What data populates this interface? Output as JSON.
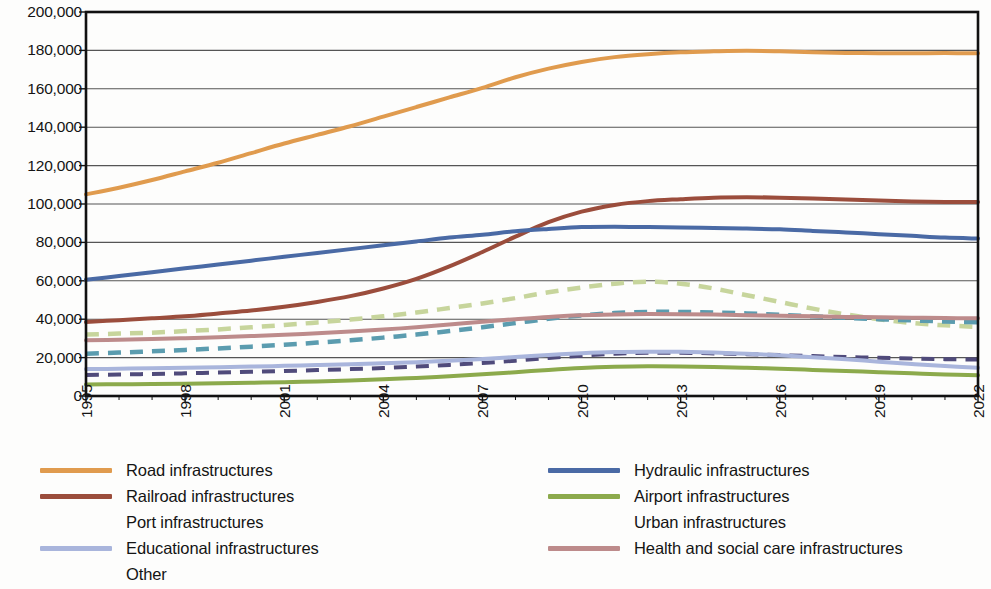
{
  "chart_data": {
    "type": "line",
    "title": "",
    "xlabel": "",
    "ylabel": "",
    "xlim": [
      1995,
      2022
    ],
    "ylim": [
      0,
      200000
    ],
    "ytick_step": 20000,
    "ytick_labels": [
      "0",
      "20,000",
      "40,000",
      "60,000",
      "80,000",
      "100,000",
      "120,000",
      "140,000",
      "160,000",
      "180,000",
      "200,000"
    ],
    "ytick_values": [
      0,
      20000,
      40000,
      60000,
      80000,
      100000,
      120000,
      140000,
      160000,
      180000,
      200000
    ],
    "xtick_labels": [
      "1995",
      "1998",
      "2001",
      "2004",
      "2007",
      "2010",
      "2013",
      "2016",
      "2019",
      "2022"
    ],
    "xtick_values": [
      1995,
      1998,
      2001,
      2004,
      2007,
      2010,
      2013,
      2016,
      2019,
      2022
    ],
    "x": [
      1995,
      1996,
      1997,
      1998,
      1999,
      2000,
      2001,
      2002,
      2003,
      2004,
      2005,
      2006,
      2007,
      2008,
      2009,
      2010,
      2011,
      2012,
      2013,
      2014,
      2015,
      2016,
      2017,
      2018,
      2019,
      2020,
      2021,
      2022
    ],
    "grid": "horizontal",
    "legend_position": "bottom",
    "legend_columns": 2,
    "series": [
      {
        "name": "Road infrastructures",
        "color": "#E09B4E",
        "style": "solid",
        "width": 4.0,
        "values": [
          105000,
          108500,
          112500,
          117000,
          121500,
          126500,
          131500,
          136000,
          140500,
          145500,
          150500,
          155500,
          160500,
          166000,
          170500,
          174000,
          176500,
          178000,
          179000,
          179500,
          179800,
          179500,
          179000,
          178700,
          178500,
          178500,
          178600,
          178500
        ]
      },
      {
        "name": "Railroad infrastructures",
        "color": "#9B4D3C",
        "style": "solid",
        "width": 4.0,
        "values": [
          38500,
          39500,
          40500,
          41500,
          43000,
          44500,
          46500,
          49000,
          52000,
          56000,
          61000,
          67500,
          75000,
          83000,
          90500,
          96000,
          99500,
          101500,
          102500,
          103300,
          103500,
          103300,
          102800,
          102300,
          101800,
          101300,
          101000,
          101000
        ]
      },
      {
        "name": "Port infrastructures",
        "color": "#504B7B",
        "style": "dashed",
        "width": 4.0,
        "values": [
          11000,
          11200,
          11500,
          11800,
          12200,
          12600,
          13000,
          13500,
          14000,
          14600,
          15300,
          16200,
          17200,
          18400,
          19800,
          21000,
          22000,
          22500,
          22500,
          22200,
          21800,
          21300,
          20800,
          20300,
          19900,
          19500,
          19200,
          19000
        ]
      },
      {
        "name": "Educational infrastructures",
        "color": "#A9B5DC",
        "style": "solid",
        "width": 4.0,
        "values": [
          14000,
          14200,
          14400,
          14700,
          15000,
          15300,
          15700,
          16100,
          16500,
          17000,
          17600,
          18400,
          19300,
          20300,
          21400,
          22300,
          22900,
          23100,
          23000,
          22600,
          22000,
          21200,
          20200,
          19100,
          17900,
          16700,
          15600,
          14700
        ]
      },
      {
        "name": "Other",
        "color": "#C7D59C",
        "style": "dashed",
        "width": 4.5,
        "values": [
          32000,
          32500,
          33000,
          33800,
          34700,
          35800,
          37000,
          38300,
          39800,
          41500,
          43500,
          45800,
          48200,
          51000,
          54000,
          56500,
          58500,
          59500,
          58500,
          56000,
          52500,
          49000,
          45500,
          42500,
          40000,
          38000,
          36800,
          36000
        ]
      },
      {
        "name": "Hydraulic infrastructures",
        "color": "#4A6AA5",
        "style": "solid",
        "width": 4.0,
        "values": [
          60500,
          62500,
          64500,
          66500,
          68500,
          70500,
          72500,
          74500,
          76500,
          78500,
          80500,
          82500,
          84000,
          85800,
          87000,
          88000,
          88200,
          88000,
          87800,
          87500,
          87200,
          86800,
          86000,
          85200,
          84300,
          83400,
          82500,
          82000
        ]
      },
      {
        "name": "Airport infrastructures",
        "color": "#8CAA4C",
        "style": "solid",
        "width": 4.0,
        "values": [
          6000,
          6100,
          6200,
          6400,
          6600,
          6900,
          7200,
          7600,
          8100,
          8700,
          9400,
          10300,
          11300,
          12400,
          13600,
          14600,
          15200,
          15500,
          15400,
          15100,
          14700,
          14200,
          13600,
          13000,
          12400,
          11800,
          11200,
          10800
        ]
      },
      {
        "name": "Urban infrastructures",
        "color": "#5B9CAF",
        "style": "dashed",
        "width": 4.5,
        "values": [
          22000,
          22600,
          23300,
          24000,
          24800,
          25700,
          26700,
          27800,
          29000,
          30400,
          32000,
          33800,
          35800,
          38000,
          40200,
          42000,
          43200,
          43800,
          43800,
          43500,
          43000,
          42300,
          41500,
          40700,
          40000,
          39400,
          38800,
          38400
        ]
      },
      {
        "name": "Health and social care infrastructures",
        "color": "#BD8B8B",
        "style": "solid",
        "width": 4.0,
        "values": [
          29000,
          29300,
          29700,
          30100,
          30600,
          31200,
          31900,
          32700,
          33600,
          34600,
          35800,
          37200,
          38700,
          40000,
          41200,
          42000,
          42500,
          42700,
          42600,
          42400,
          42100,
          41800,
          41500,
          41200,
          41000,
          40800,
          40600,
          40500
        ]
      }
    ]
  },
  "legend": {
    "left_column": [
      {
        "label": "Road infrastructures",
        "color": "#E09B4E",
        "style": "solid"
      },
      {
        "label": "Railroad infrastructures",
        "color": "#9B4D3C",
        "style": "solid"
      },
      {
        "label": "Port infrastructures",
        "color": "#504B7B",
        "style": "dashed"
      },
      {
        "label": "Educational infrastructures",
        "color": "#A9B5DC",
        "style": "solid"
      },
      {
        "label": "Other",
        "color": "#C7D59C",
        "style": "dashed"
      }
    ],
    "right_column": [
      {
        "label": "Hydraulic infrastructures",
        "color": "#4A6AA5",
        "style": "solid"
      },
      {
        "label": "Airport infrastructures",
        "color": "#8CAA4C",
        "style": "solid"
      },
      {
        "label": "Urban infrastructures",
        "color": "#5B9CAF",
        "style": "dashed"
      },
      {
        "label": "Health and social care infrastructures",
        "color": "#BD8B8B",
        "style": "solid"
      }
    ]
  },
  "style": {
    "axis_color": "#111111",
    "grid_color": "#555555",
    "background": "#fdfdfc",
    "text_color": "#141414"
  }
}
